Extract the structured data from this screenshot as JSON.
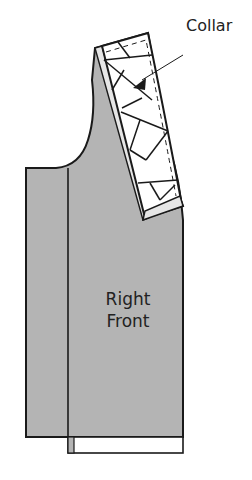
{
  "diagram": {
    "labels": {
      "collar": "Collar",
      "piece_line1": "Right",
      "piece_line2": "Front"
    },
    "colors": {
      "fabric": "#b4b4b4",
      "outline": "#1a1a1a",
      "collar_fill": "#ffffff",
      "background": "#ffffff"
    }
  }
}
